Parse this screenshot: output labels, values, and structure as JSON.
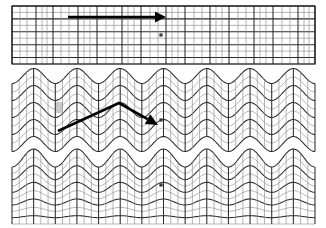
{
  "figure": {
    "title": "",
    "background_color": "#ffffff",
    "width": 326,
    "height": 228,
    "line_colors": {
      "frame": "#111111",
      "grid_major": "#2b2b2b",
      "grid_minor": "#8d8d8d",
      "arrow": "#000000",
      "marker": "#3a3a3a",
      "shaded_cell": "#c9c9c9"
    }
  },
  "panels": [
    {
      "id": "panel-top",
      "label": "",
      "state": "undeformed-flat-mesh",
      "x": 12,
      "y": 6,
      "width": 303,
      "height": 58,
      "rows": 9,
      "wave_amplitude_top": 0,
      "wave_amplitude_bottom": 0,
      "wave_periods": 0,
      "annotation": {
        "type": "straight-arrow",
        "direction": "right",
        "from_x": 68,
        "from_y": 17,
        "to_x": 166,
        "to_y": 17
      },
      "marker": {
        "x": 161,
        "y": 35
      },
      "column_groups": [
        {
          "x": 12,
          "weight": "major"
        },
        {
          "x": 20,
          "weight": "minor"
        },
        {
          "x": 27,
          "weight": "minor"
        },
        {
          "x": 36,
          "weight": "major"
        },
        {
          "x": 42,
          "weight": "minor"
        },
        {
          "x": 47,
          "weight": "minor"
        },
        {
          "x": 53,
          "weight": "major"
        },
        {
          "x": 61,
          "weight": "minor"
        },
        {
          "x": 69,
          "weight": "minor"
        },
        {
          "x": 78,
          "weight": "major"
        },
        {
          "x": 84,
          "weight": "minor"
        },
        {
          "x": 90,
          "weight": "minor"
        },
        {
          "x": 97,
          "weight": "major"
        },
        {
          "x": 106,
          "weight": "minor"
        },
        {
          "x": 114,
          "weight": "minor"
        },
        {
          "x": 122,
          "weight": "major"
        },
        {
          "x": 128,
          "weight": "minor"
        },
        {
          "x": 134,
          "weight": "minor"
        },
        {
          "x": 141,
          "weight": "major"
        },
        {
          "x": 150,
          "weight": "minor"
        },
        {
          "x": 158,
          "weight": "minor"
        },
        {
          "x": 166,
          "weight": "major"
        },
        {
          "x": 172,
          "weight": "minor"
        },
        {
          "x": 178,
          "weight": "minor"
        },
        {
          "x": 185,
          "weight": "major"
        },
        {
          "x": 194,
          "weight": "minor"
        },
        {
          "x": 202,
          "weight": "minor"
        },
        {
          "x": 210,
          "weight": "major"
        },
        {
          "x": 216,
          "weight": "minor"
        },
        {
          "x": 222,
          "weight": "minor"
        },
        {
          "x": 229,
          "weight": "major"
        },
        {
          "x": 238,
          "weight": "minor"
        },
        {
          "x": 246,
          "weight": "minor"
        },
        {
          "x": 254,
          "weight": "major"
        },
        {
          "x": 260,
          "weight": "minor"
        },
        {
          "x": 266,
          "weight": "minor"
        },
        {
          "x": 273,
          "weight": "major"
        },
        {
          "x": 282,
          "weight": "minor"
        },
        {
          "x": 290,
          "weight": "minor"
        },
        {
          "x": 298,
          "weight": "major"
        },
        {
          "x": 304,
          "weight": "minor"
        },
        {
          "x": 309,
          "weight": "minor"
        },
        {
          "x": 315,
          "weight": "major"
        }
      ]
    },
    {
      "id": "panel-middle",
      "label": "",
      "state": "uniformly-corrugated-mesh",
      "x": 12,
      "y": 76,
      "width": 303,
      "height": 68,
      "rows": 8,
      "columns": 42,
      "wave_amplitude_top": 7.5,
      "wave_amplitude_bottom": 7.5,
      "wave_periods": 7,
      "annotation": {
        "type": "bent-arrow",
        "direction": "down-right",
        "from_x": 58,
        "from_y": 131,
        "apex_x": 119,
        "apex_y": 103,
        "to_x": 158,
        "to_y": 125
      },
      "marker": {
        "x": 161,
        "y": 120
      },
      "shaded_cell": {
        "x": 56,
        "y": 102,
        "width": 7,
        "height": 11
      }
    },
    {
      "id": "panel-bottom",
      "label": "",
      "state": "surface-wave-decaying-with-depth",
      "x": 12,
      "y": 158,
      "width": 303,
      "height": 66,
      "rows": 9,
      "columns": 42,
      "wave_amplitude_top": 9,
      "wave_amplitude_bottom": 0,
      "wave_periods": 7,
      "annotation": null,
      "marker": {
        "x": 161,
        "y": 185
      }
    }
  ]
}
